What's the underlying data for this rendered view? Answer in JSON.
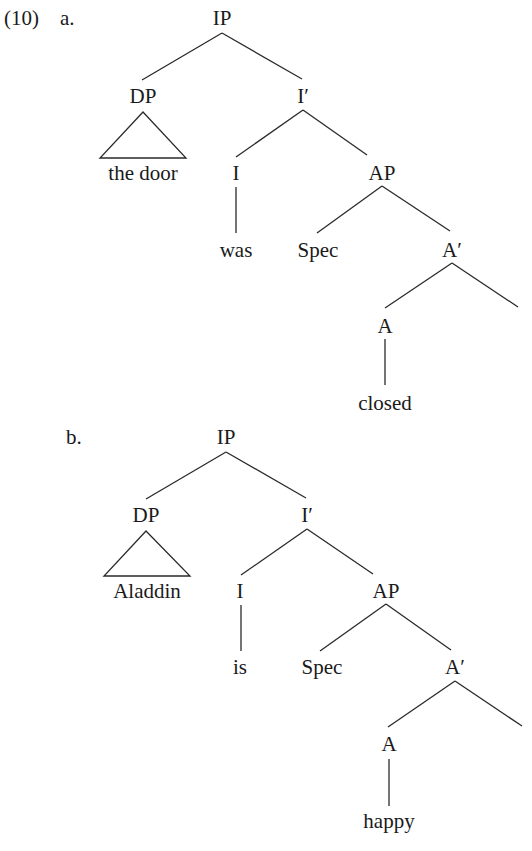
{
  "example_number": "(10)",
  "trees": [
    {
      "label": "a.",
      "nodes": {
        "root": "IP",
        "subject": "DP",
        "subject_leaf": "the door",
        "i_bar": "I′",
        "head_i": "I",
        "head_i_leaf": "was",
        "ap": "AP",
        "spec": "Spec",
        "a_bar": "A′",
        "head_a": "A",
        "head_a_leaf": "closed"
      }
    },
    {
      "label": "b.",
      "nodes": {
        "root": "IP",
        "subject": "DP",
        "subject_leaf": "Aladdin",
        "i_bar": "I′",
        "head_i": "I",
        "head_i_leaf": "is",
        "ap": "AP",
        "spec": "Spec",
        "a_bar": "A′",
        "head_a": "A",
        "head_a_leaf": "happy"
      }
    }
  ]
}
